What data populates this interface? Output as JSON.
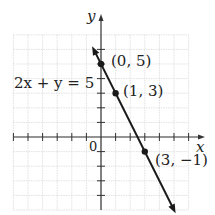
{
  "chart_data": {
    "type": "line",
    "title": "",
    "xlabel": "x",
    "ylabel": "y",
    "equation": "2x + y = 5",
    "origin_label": "0",
    "grid": true,
    "xlim": [
      -6,
      6
    ],
    "ylim": [
      -5,
      7
    ],
    "series": [
      {
        "name": "2x + y = 5",
        "x": [
          -0.5,
          5
        ],
        "y": [
          6,
          -5
        ]
      }
    ],
    "points": [
      {
        "x": 0,
        "y": 5,
        "label": "(0, 5)"
      },
      {
        "x": 1,
        "y": 3,
        "label": "(1, 3)"
      },
      {
        "x": 3,
        "y": -1,
        "label": "(3, −1)"
      }
    ],
    "colors": {
      "line": "#1a1a1a",
      "grid": "#d9d9d9",
      "axis": "#333333"
    }
  },
  "labels": {
    "y_axis": "y",
    "x_axis": "x",
    "origin": "0",
    "eq_left": "2x + y = 5",
    "p1": "(0, 5)",
    "p2": "(1, 3)",
    "p3": "(3, −1)"
  }
}
